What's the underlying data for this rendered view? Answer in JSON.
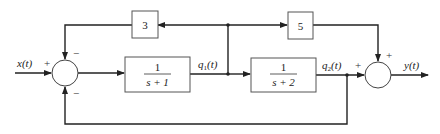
{
  "diagram": {
    "type": "block-diagram",
    "signals": {
      "input": "x(t)",
      "q1": "q1(t)",
      "q2": "q2(t)",
      "output": "y(t)"
    },
    "signal_parts": {
      "input": {
        "base": "x",
        "arg": "(t)"
      },
      "q1": {
        "base": "q",
        "sub": "1",
        "arg": "(t)"
      },
      "q2": {
        "base": "q",
        "sub": "2",
        "arg": "(t)"
      },
      "output": {
        "base": "y",
        "arg": "(t)"
      }
    },
    "blocks": [
      {
        "id": "G1",
        "numerator": "1",
        "denominator": "s + 1"
      },
      {
        "id": "G2",
        "numerator": "1",
        "denominator": "s + 2"
      },
      {
        "id": "K3",
        "gain": "3"
      },
      {
        "id": "K5",
        "gain": "5"
      }
    ],
    "summing_junctions": {
      "left": {
        "input_sign": "+",
        "top_sign": "−",
        "bottom_sign": "−"
      },
      "right": {
        "left_sign": "+",
        "top_sign": "+"
      }
    },
    "colors": {
      "line": "#222222",
      "block_border": "#555555",
      "background": "#ffffff"
    }
  }
}
